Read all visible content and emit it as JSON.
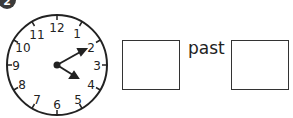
{
  "question": {
    "number": "2",
    "clock": {
      "numbers": [
        "12",
        "1",
        "2",
        "3",
        "4",
        "5",
        "6",
        "7",
        "8",
        "9",
        "10",
        "11"
      ],
      "hour_hand_points_to": "4",
      "minute_hand_points_to": "2"
    },
    "answer_word": "past",
    "answer_boxes": [
      "",
      ""
    ]
  }
}
